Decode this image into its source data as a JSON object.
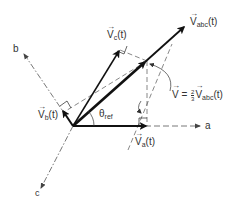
{
  "diagram": {
    "axes": {
      "a": {
        "label": "a",
        "style": "dashed"
      },
      "b": {
        "label": "b",
        "style": "dashed"
      },
      "c": {
        "label": "c",
        "style": "dashed"
      }
    },
    "vectors": {
      "va": {
        "label_main": "V",
        "label_sub": "a",
        "label_suffix": "(t)"
      },
      "vb": {
        "label_main": "V",
        "label_sub": "b",
        "label_suffix": "(t)"
      },
      "vc": {
        "label_main": "V",
        "label_sub": "c",
        "label_suffix": "(t)"
      },
      "vabc": {
        "label_main": "V",
        "label_sub": "abc",
        "label_suffix": "(t)"
      },
      "v": {
        "label_main": "V",
        "equals": " = ",
        "frac_num": "2",
        "frac_den": "3",
        "rhs_main": "V",
        "rhs_sub": "abc",
        "rhs_suffix": "(t)"
      }
    },
    "angle": {
      "symbol": "θ",
      "sub": "ref"
    },
    "arrow_glyph": "→",
    "colors": {
      "stroke": "#111111",
      "dashed": "#555555",
      "text": "#333333"
    }
  }
}
